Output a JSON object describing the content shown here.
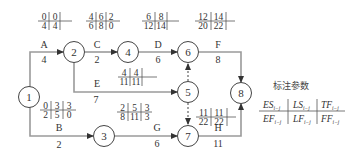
{
  "diagram": {
    "type": "double-code network (activity-on-arrow)",
    "nodes": [
      {
        "id": "1",
        "label": "1"
      },
      {
        "id": "2",
        "label": "2"
      },
      {
        "id": "3",
        "label": "3"
      },
      {
        "id": "4",
        "label": "4"
      },
      {
        "id": "5",
        "label": "5"
      },
      {
        "id": "6",
        "label": "6"
      },
      {
        "id": "7",
        "label": "7"
      },
      {
        "id": "8",
        "label": "8"
      }
    ],
    "activities": [
      {
        "name": "A",
        "from": "1",
        "to": "2",
        "duration": "4",
        "ES": "0",
        "LS": "0",
        "TF": "",
        "EF": "4",
        "LF": "4",
        "FF": ""
      },
      {
        "name": "B",
        "from": "1",
        "to": "3",
        "duration": "2",
        "ES": "0",
        "LS": "3",
        "TF": "3",
        "EF": "2",
        "LF": "5",
        "FF": "0"
      },
      {
        "name": "C",
        "from": "2",
        "to": "4",
        "duration": "2",
        "ES": "4",
        "LS": "6",
        "TF": "2",
        "EF": "6",
        "LF": "8",
        "FF": "0"
      },
      {
        "name": "D",
        "from": "4",
        "to": "6",
        "duration": "6",
        "ES": "6",
        "LS": "8",
        "TF": "",
        "EF": "12",
        "LF": "14",
        "FF": ""
      },
      {
        "name": "E",
        "from": "2",
        "to": "5",
        "duration": "7",
        "ES": "4",
        "LS": "4",
        "TF": "",
        "EF": "11",
        "LF": "11",
        "FF": ""
      },
      {
        "name": "F",
        "from": "6",
        "to": "8",
        "duration": "8",
        "ES": "12",
        "LS": "14",
        "TF": "",
        "EF": "20",
        "LF": "22",
        "FF": ""
      },
      {
        "name": "G",
        "from": "3",
        "to": "7",
        "duration": "6",
        "ES": "2",
        "LS": "5",
        "TF": "3",
        "EF": "8",
        "LF": "11",
        "FF": "3"
      },
      {
        "name": "H",
        "from": "7",
        "to": "8",
        "duration": "11",
        "ES": "11",
        "LS": "11",
        "TF": "",
        "EF": "22",
        "LF": "22",
        "FF": ""
      }
    ],
    "dummy_activities": [
      {
        "from": "5",
        "to": "6"
      },
      {
        "from": "5",
        "to": "7"
      }
    ]
  },
  "legend": {
    "title": "标注参数",
    "top": [
      "ES",
      "LS",
      "TF"
    ],
    "bottom": [
      "EF",
      "LF",
      "FF"
    ],
    "subscript": "i−j"
  }
}
